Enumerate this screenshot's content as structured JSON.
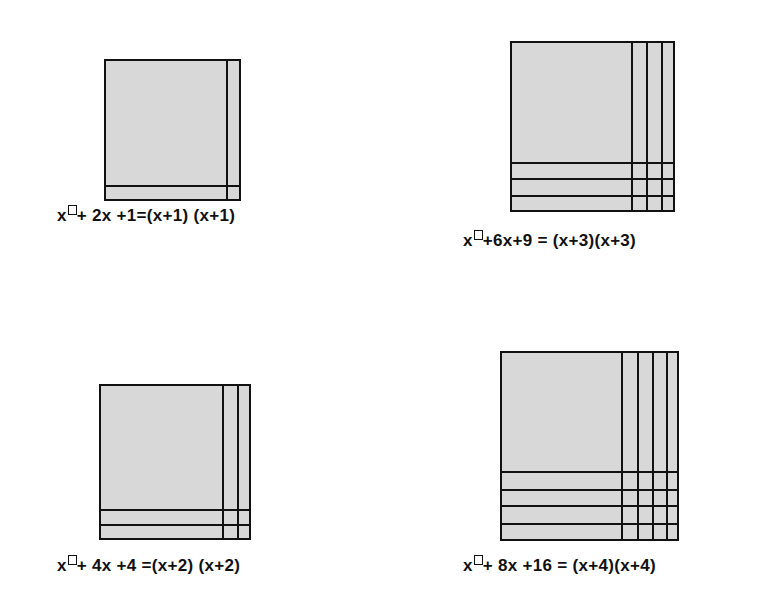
{
  "colors": {
    "tile_fill": "#d8d8d8",
    "line": "#111111",
    "background": "#ffffff"
  },
  "diagrams": [
    {
      "id": "n1",
      "n": 1,
      "label_prefix": "x",
      "label_rest": "+ 2x +1=(x+1) (x+1)",
      "expression": "x² + 2x + 1 = (x+1)(x+1)",
      "square": {
        "left": 104,
        "top": 59,
        "width": 137,
        "height": 142
      },
      "vlines": [
        120
      ],
      "hlines": [
        124
      ],
      "label_pos": {
        "left": 57,
        "top": 206
      }
    },
    {
      "id": "n3",
      "n": 3,
      "label_prefix": "x",
      "label_rest": "+6x+9 = (x+3)(x+3)",
      "expression": "x² + 6x + 9 = (x+3)(x+3)",
      "square": {
        "left": 510,
        "top": 41,
        "width": 165,
        "height": 171
      },
      "vlines": [
        119,
        134,
        149
      ],
      "hlines": [
        119,
        135,
        152
      ],
      "label_pos": {
        "left": 463,
        "top": 231
      }
    },
    {
      "id": "n2",
      "n": 2,
      "label_prefix": "x",
      "label_rest": "+ 4x +4 =(x+2) (x+2)",
      "expression": "x² + 4x + 4 = (x+2)(x+2)",
      "square": {
        "left": 99,
        "top": 384,
        "width": 152,
        "height": 156
      },
      "vlines": [
        121,
        136
      ],
      "hlines": [
        123,
        138
      ],
      "label_pos": {
        "left": 57,
        "top": 556
      }
    },
    {
      "id": "n4",
      "n": 4,
      "label_prefix": "x",
      "label_rest": "+ 8x +16 = (x+4)(x+4)",
      "expression": "x² + 8x + 16 = (x+4)(x+4)",
      "square": {
        "left": 500,
        "top": 351,
        "width": 179,
        "height": 190
      },
      "vlines": [
        119,
        135,
        150,
        164
      ],
      "hlines": [
        118,
        136,
        152,
        170
      ],
      "label_pos": {
        "left": 463,
        "top": 556
      }
    }
  ]
}
